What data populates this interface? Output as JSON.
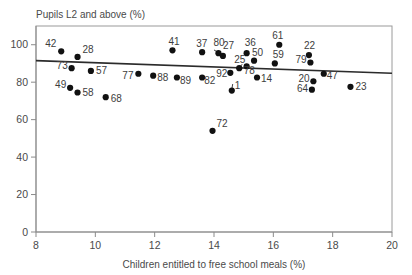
{
  "chart_data": {
    "type": "scatter",
    "title": "",
    "ylabel": "Pupils L2 and above (%)",
    "xlabel": "Children entitled to free school meals (%)",
    "xlim": [
      8,
      20
    ],
    "ylim": [
      0,
      110
    ],
    "xticks": [
      "8",
      "10",
      "12",
      "14",
      "16",
      "18",
      "20"
    ],
    "xtick_values": [
      8,
      10,
      12,
      14,
      16,
      18,
      20
    ],
    "yticks": [
      "0",
      "20",
      "40",
      "60",
      "80",
      "100"
    ],
    "ytick_values": [
      0,
      20,
      40,
      60,
      80,
      100
    ],
    "grid": false,
    "legend": false,
    "point_color": "#111111",
    "trend_line": {
      "label": "trend-line",
      "x_start": 8.0,
      "y_start": 91.5,
      "x_end": 20.0,
      "y_end": 84.8,
      "color": "#2b2b2b"
    },
    "points": [
      {
        "label": "42",
        "x": 8.85,
        "y": 96.5
      },
      {
        "label": "28",
        "x": 9.4,
        "y": 93.5
      },
      {
        "label": "73",
        "x": 9.2,
        "y": 87.5
      },
      {
        "label": "49",
        "x": 9.15,
        "y": 77.0
      },
      {
        "label": "58",
        "x": 9.4,
        "y": 74.5
      },
      {
        "label": "57",
        "x": 9.85,
        "y": 86.0
      },
      {
        "label": "68",
        "x": 10.35,
        "y": 72.0
      },
      {
        "label": "77",
        "x": 11.45,
        "y": 84.5
      },
      {
        "label": "88",
        "x": 11.95,
        "y": 83.5
      },
      {
        "label": "41",
        "x": 12.6,
        "y": 97.0
      },
      {
        "label": "89",
        "x": 12.75,
        "y": 82.5
      },
      {
        "label": "37",
        "x": 13.6,
        "y": 96.0
      },
      {
        "label": "82",
        "x": 13.6,
        "y": 82.5
      },
      {
        "label": "80",
        "x": 14.15,
        "y": 95.5
      },
      {
        "label": "72",
        "x": 13.95,
        "y": 54.0
      },
      {
        "label": "27",
        "x": 14.3,
        "y": 94.0
      },
      {
        "label": "92",
        "x": 14.55,
        "y": 85.0
      },
      {
        "label": "1",
        "x": 14.6,
        "y": 75.5
      },
      {
        "label": "25",
        "x": 14.85,
        "y": 87.5
      },
      {
        "label": "36",
        "x": 15.1,
        "y": 95.5
      },
      {
        "label": "78",
        "x": 15.1,
        "y": 88.5
      },
      {
        "label": "50",
        "x": 15.35,
        "y": 91.5
      },
      {
        "label": "14",
        "x": 15.45,
        "y": 82.5
      },
      {
        "label": "61",
        "x": 16.2,
        "y": 100.0
      },
      {
        "label": "59",
        "x": 16.05,
        "y": 90.0
      },
      {
        "label": "22",
        "x": 17.2,
        "y": 94.5
      },
      {
        "label": "79",
        "x": 17.25,
        "y": 90.5
      },
      {
        "label": "20",
        "x": 17.35,
        "y": 80.5
      },
      {
        "label": "64",
        "x": 17.3,
        "y": 76.0
      },
      {
        "label": "47",
        "x": 17.7,
        "y": 84.5
      },
      {
        "label": "23",
        "x": 18.6,
        "y": 77.5
      }
    ],
    "label_offsets": [
      {
        "label": "42",
        "dx": -16,
        "dy": -4
      },
      {
        "label": "28",
        "dx": 5,
        "dy": -4
      },
      {
        "label": "73",
        "dx": -15,
        "dy": 1
      },
      {
        "label": "49",
        "dx": -15,
        "dy": 0
      },
      {
        "label": "58",
        "dx": 5,
        "dy": 4
      },
      {
        "label": "57",
        "dx": 5,
        "dy": 3
      },
      {
        "label": "68",
        "dx": 5,
        "dy": 5
      },
      {
        "label": "77",
        "dx": -16,
        "dy": 5
      },
      {
        "label": "88",
        "dx": 4,
        "dy": 5
      },
      {
        "label": "41",
        "dx": -4,
        "dy": -5
      },
      {
        "label": "89",
        "dx": 3,
        "dy": 6
      },
      {
        "label": "37",
        "dx": -6,
        "dy": -5
      },
      {
        "label": "82",
        "dx": 2,
        "dy": 6
      },
      {
        "label": "80",
        "dx": -5,
        "dy": -7
      },
      {
        "label": "72",
        "dx": 4,
        "dy": -4
      },
      {
        "label": "27",
        "dx": 0,
        "dy": -7
      },
      {
        "label": "92",
        "dx": -14,
        "dy": 4
      },
      {
        "label": "1",
        "dx": 3,
        "dy": -2
      },
      {
        "label": "25",
        "dx": -5,
        "dy": -5
      },
      {
        "label": "36",
        "dx": -2,
        "dy": -7
      },
      {
        "label": "78",
        "dx": -3,
        "dy": 8
      },
      {
        "label": "50",
        "dx": -2,
        "dy": -5
      },
      {
        "label": "14",
        "dx": 4,
        "dy": 4
      },
      {
        "label": "61",
        "dx": -7,
        "dy": -6
      },
      {
        "label": "59",
        "dx": -2,
        "dy": -5
      },
      {
        "label": "22",
        "dx": -5,
        "dy": -6
      },
      {
        "label": "79",
        "dx": -15,
        "dy": 0
      },
      {
        "label": "20",
        "dx": -15,
        "dy": 1
      },
      {
        "label": "64",
        "dx": -15,
        "dy": 2
      },
      {
        "label": "47",
        "dx": 3,
        "dy": 5
      },
      {
        "label": "23",
        "dx": 5,
        "dy": 3
      }
    ],
    "leaders": [
      {
        "label": "80",
        "x1": 14.0,
        "y1": 97.2,
        "x2": 14.18,
        "y2": 95.6
      },
      {
        "label": "1",
        "x1": 14.63,
        "y1": 79.0,
        "x2": 14.6,
        "y2": 76.2
      },
      {
        "label": "25",
        "x1": 14.95,
        "y1": 89.6,
        "x2": 14.86,
        "y2": 87.8
      }
    ]
  }
}
